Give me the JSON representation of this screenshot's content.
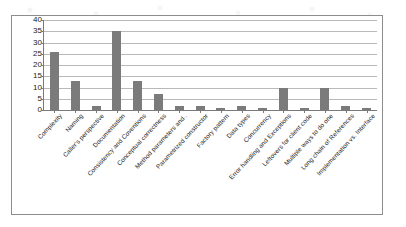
{
  "chart_data": {
    "type": "bar",
    "title": "",
    "xlabel": "",
    "ylabel": "",
    "ylim": [
      0,
      40
    ],
    "yticks": [
      40,
      35,
      30,
      25,
      20,
      15,
      10,
      5,
      0
    ],
    "grid": true,
    "legend": "none",
    "series_color": "#7b7b7b",
    "categories": [
      "Complexity",
      "Naming",
      "Caller's perspective",
      "Documentation",
      "Consistency and Coventions",
      "Conceptual correctness",
      "Method parameters and..",
      "Parametrized constructor",
      "Factory pattern",
      "Data types",
      "Concurrency",
      "Error handling and Exceptions",
      "Leftovers for client code",
      "Multiple ways to do one",
      "Long chain of References",
      "Implementation vs. Interface"
    ],
    "values": [
      26,
      13,
      2,
      35,
      13,
      7,
      2,
      2,
      1,
      2,
      1,
      10,
      1,
      10,
      2,
      1
    ]
  }
}
